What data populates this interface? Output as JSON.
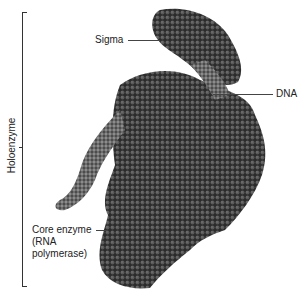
{
  "figure": {
    "labels": {
      "bracket": "Holoenzyme",
      "sigma": "Sigma",
      "dna": "DNA",
      "core_line1": "Core enzyme",
      "core_line2": "(RNA",
      "core_line3": "polymerase)"
    },
    "colors": {
      "background": "#ffffff",
      "protein_dark": "#2a2a2a",
      "protein_mid": "#555555",
      "dna_light": "#8a8a8a",
      "text": "#222222"
    }
  }
}
